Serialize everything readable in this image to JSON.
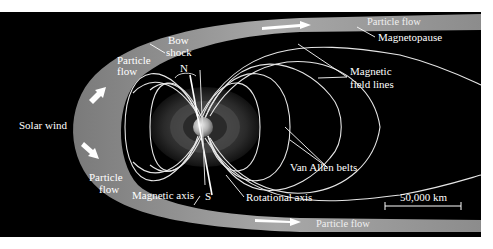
{
  "diagram": {
    "colors": {
      "background": "#000000",
      "page": "#ffffff",
      "bow_shock_band": "#9a9a9a",
      "field_lines": "#e6e6e6",
      "labels": "#ffffff"
    },
    "labels": {
      "solar_wind": "Solar wind",
      "bow_shock_line1": "Bow",
      "bow_shock_line2": "shock",
      "particle_flow_upper_line1": "Particle",
      "particle_flow_upper_line2": "flow",
      "particle_flow_lower_line1": "Particle",
      "particle_flow_lower_line2": "flow",
      "particle_flow_top": "Particle flow",
      "particle_flow_bottom": "Particle flow",
      "magnetopause": "Magnetopause",
      "magnetic_field_lines_line1": "Magnetic",
      "magnetic_field_lines_line2": "field lines",
      "van_allen_belts": "Van Allen belts",
      "north": "N",
      "south": "S",
      "magnetic_axis": "Magnetic axis",
      "rotational_axis": "Rotational axis",
      "scale_bar": "50,000 km"
    },
    "nodes": [
      {
        "id": "sun_side",
        "label": "Solar wind"
      },
      {
        "id": "bow_shock",
        "label": "Bow shock"
      },
      {
        "id": "magnetopause",
        "label": "Magnetopause"
      },
      {
        "id": "earth",
        "label": "Earth"
      },
      {
        "id": "van_allen_belts",
        "label": "Van Allen belts"
      },
      {
        "id": "field_lines",
        "label": "Magnetic field lines"
      }
    ],
    "scale": {
      "length_km": 50000
    }
  }
}
